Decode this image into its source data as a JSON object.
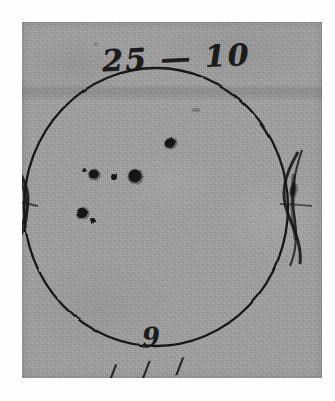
{
  "document": {
    "kind": "scanned-handwritten-astronomical-drawing",
    "subject": "sunspot-disk-sketch",
    "paper_color": "#a3a3a3",
    "ink_color": "#1b1b1b",
    "background_color": "#fdfdfd"
  },
  "annotations": {
    "header_note": "25 — 10",
    "header_left_number": "25",
    "header_dash": "—",
    "header_right_number": "10",
    "bottom_note": "9",
    "bottom_note_cut_off": "/ / /"
  },
  "disk": {
    "label": "solar-disk-outline",
    "center_x": 156,
    "center_y": 207,
    "radius_x": 132,
    "radius_y": 139,
    "stroke_color": "#141414",
    "stroke_width": 2.3
  },
  "limb_marks": [
    {
      "name": "left-limb-cross",
      "x": 24,
      "y": 185
    },
    {
      "name": "right-limb-cross",
      "x": 288,
      "y": 185
    }
  ],
  "chart_data": {
    "type": "scatter",
    "title": "25 — 10",
    "xlabel": "",
    "ylabel": "",
    "grid": false,
    "legend": "none",
    "xlim": [
      22,
      322
    ],
    "ylim": [
      22,
      378
    ],
    "annotations": [
      "25 — 10",
      "9"
    ],
    "series": [
      {
        "name": "sunspots",
        "marker": "filled-blob",
        "color": "#141414",
        "points": [
          {
            "id": "spot-1",
            "label": "upper-central-spot",
            "x": 170,
            "y": 143,
            "w": 11,
            "h": 9,
            "rot": -28
          },
          {
            "id": "spot-2",
            "label": "central-large-spot",
            "x": 135,
            "y": 176,
            "w": 13,
            "h": 13,
            "rot": 12
          },
          {
            "id": "spot-3",
            "label": "central-small-spot",
            "x": 114,
            "y": 177,
            "w": 6,
            "h": 6,
            "rot": 0
          },
          {
            "id": "spot-4",
            "label": "west-medium-spot",
            "x": 94,
            "y": 174,
            "w": 10,
            "h": 9,
            "rot": 18
          },
          {
            "id": "spot-5",
            "label": "west-tiny-spot",
            "x": 84,
            "y": 170,
            "w": 4,
            "h": 4,
            "rot": 0
          },
          {
            "id": "spot-6",
            "label": "lower-left-medium-spot",
            "x": 82,
            "y": 213,
            "w": 11,
            "h": 10,
            "rot": -15
          },
          {
            "id": "spot-7",
            "label": "lower-left-small-spot",
            "x": 93,
            "y": 221,
            "w": 6,
            "h": 6,
            "rot": 0
          },
          {
            "id": "spot-8",
            "label": "east-limb-elongated-spot",
            "x": 293,
            "y": 190,
            "w": 5,
            "h": 14,
            "rot": 8
          }
        ]
      }
    ]
  },
  "blemishes": [
    {
      "name": "paper-speck-upper-right",
      "x": 196,
      "y": 110,
      "w": 9,
      "h": 4
    },
    {
      "name": "paper-speck-upper-left",
      "x": 96,
      "y": 44,
      "w": 4,
      "h": 3
    }
  ]
}
